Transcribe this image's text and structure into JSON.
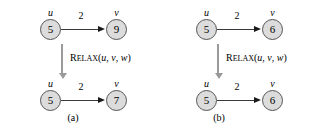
{
  "figure": {
    "node_fill": "#dcdcdc",
    "node_stroke": "#555555",
    "edge_color": "#3a3a3a",
    "relax_arrow_color": "#9a9a9a",
    "text_color": "#000000",
    "background": "#ffffff"
  },
  "panels": [
    {
      "caption": "(a)",
      "before": {
        "source": {
          "label": "u",
          "value": "5"
        },
        "target": {
          "label": "v",
          "value": "9"
        },
        "weight": "2"
      },
      "operation": {
        "name_cap": "R",
        "name_rest": "ELAX",
        "open_paren": "(",
        "arg1": "u",
        "comma1": ", ",
        "arg2": "v",
        "comma2": ", ",
        "arg3": "w",
        "close_paren": ")"
      },
      "after": {
        "source": {
          "label": "u",
          "value": "5"
        },
        "target": {
          "label": "v",
          "value": "7"
        },
        "weight": "2"
      }
    },
    {
      "caption": "(b)",
      "before": {
        "source": {
          "label": "u",
          "value": "5"
        },
        "target": {
          "label": "v",
          "value": "6"
        },
        "weight": "2"
      },
      "operation": {
        "name_cap": "R",
        "name_rest": "ELAX",
        "open_paren": "(",
        "arg1": "u",
        "comma1": ", ",
        "arg2": "v",
        "comma2": ", ",
        "arg3": "w",
        "close_paren": ")"
      },
      "after": {
        "source": {
          "label": "u",
          "value": "5"
        },
        "target": {
          "label": "v",
          "value": "6"
        },
        "weight": "2"
      }
    }
  ]
}
